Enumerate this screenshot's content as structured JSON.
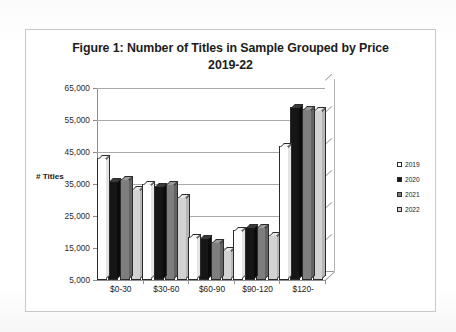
{
  "chart_data": {
    "type": "bar",
    "title": "Figure 1: Number of Titles in Sample Grouped by Price 2019-22",
    "title_line1": "Figure 1: Number of Titles in Sample Grouped by Price",
    "title_line2": "2019-22",
    "xlabel": "",
    "ylabel": "# Titles",
    "ylim": [
      5000,
      65000
    ],
    "ytick_labels": [
      "65,000",
      "55,000",
      "45,000",
      "35,000",
      "25,000",
      "15,000",
      "5,000"
    ],
    "ytick_values": [
      65000,
      55000,
      45000,
      35000,
      25000,
      15000,
      5000
    ],
    "grid": true,
    "legend_position": "right",
    "categories": [
      "$0-30",
      "$30-60",
      "$60-90",
      "$90-120",
      "$120-"
    ],
    "series": [
      {
        "name": "2019",
        "color": "#ffffff",
        "values": [
          43000,
          35000,
          18500,
          20500,
          47000
        ]
      },
      {
        "name": "2020",
        "color": "#161616",
        "values": [
          36000,
          34500,
          18000,
          21500,
          59000
        ]
      },
      {
        "name": "2021",
        "color": "#7e7e7e",
        "values": [
          36500,
          35000,
          17000,
          21500,
          58500
        ]
      },
      {
        "name": "2022",
        "color": "#d2d2d2",
        "values": [
          33500,
          31000,
          14500,
          19000,
          58000
        ]
      }
    ]
  },
  "legend": {
    "items": [
      {
        "label": "2019"
      },
      {
        "label": "2020"
      },
      {
        "label": "2021"
      },
      {
        "label": "2022"
      }
    ]
  }
}
